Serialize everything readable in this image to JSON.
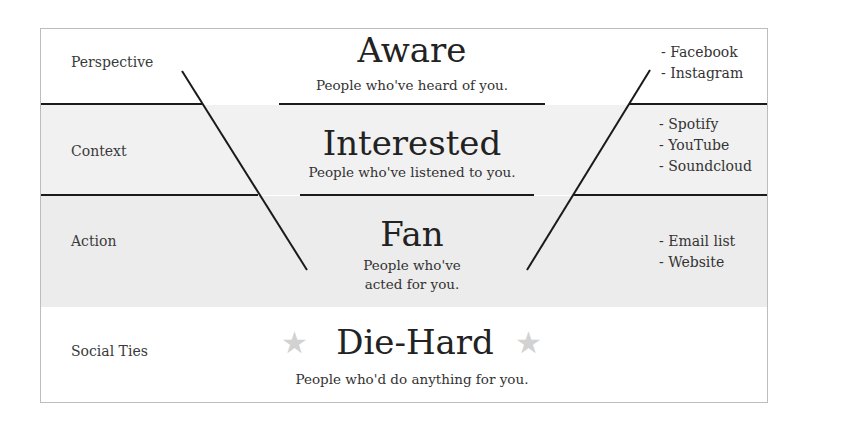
{
  "diagram": {
    "type": "funnel-hourglass",
    "colors": {
      "frame_border": "#bdbdbd",
      "band_white": "#ffffff",
      "band_grey_light": "#f1f1f1",
      "band_grey": "#ececec",
      "line": "#1a1a1a",
      "star": "#d2d2d2",
      "text": "#2b2b2b"
    },
    "rows": [
      {
        "label": "Perspective",
        "stage": "Aware",
        "description": "People who've heard of you.",
        "platforms": [
          "- Facebook",
          "- Instagram"
        ]
      },
      {
        "label": "Context",
        "stage": "Interested",
        "description": "People who've listened to you.",
        "platforms": [
          "- Spotify",
          "- YouTube",
          "- Soundcloud"
        ]
      },
      {
        "label": "Action",
        "stage": "Fan",
        "description_lines": [
          "People who've",
          "acted for you."
        ],
        "platforms": [
          "- Email list",
          "- Website"
        ]
      },
      {
        "label": "Social Ties",
        "stage": "Die-Hard",
        "description": "People who'd do anything for you.",
        "icons": [
          "star-icon",
          "star-icon"
        ],
        "star_glyph": "★"
      }
    ]
  }
}
